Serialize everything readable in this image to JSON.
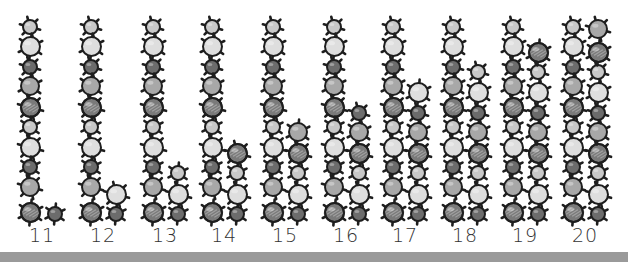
{
  "groups": [
    {
      "label": "11",
      "total": 11,
      "tens": 10,
      "ones": 1
    },
    {
      "label": "12",
      "total": 12,
      "tens": 10,
      "ones": 2
    },
    {
      "label": "13",
      "total": 13,
      "tens": 10,
      "ones": 3
    },
    {
      "label": "14",
      "total": 14,
      "tens": 10,
      "ones": 4
    },
    {
      "label": "15",
      "total": 15,
      "tens": 10,
      "ones": 5
    },
    {
      "label": "16",
      "total": 16,
      "tens": 10,
      "ones": 6
    },
    {
      "label": "17",
      "total": 17,
      "tens": 10,
      "ones": 7
    },
    {
      "label": "18",
      "total": 18,
      "tens": 10,
      "ones": 8
    },
    {
      "label": "19",
      "total": 19,
      "tens": 10,
      "ones": 9
    },
    {
      "label": "20",
      "total": 20,
      "tens": 10,
      "ones": 10
    }
  ],
  "bead_styles": {
    "small_light": {
      "r": 7,
      "fill": "#c8c8c8",
      "stripe": false
    },
    "large_pale": {
      "r": 9.5,
      "fill": "#dedede",
      "stripe": false
    },
    "small_dark": {
      "r": 7,
      "fill": "#6c6c6c",
      "stripe": false
    },
    "medium_gray": {
      "r": 9,
      "fill": "#a8a8a8",
      "stripe": false
    },
    "large_striped": {
      "r": 9.5,
      "fill": "#7a7a7a",
      "stripe": true
    }
  },
  "tens_pattern_top_to_bottom": [
    "small_light",
    "large_pale",
    "small_dark",
    "medium_gray",
    "large_striped",
    "small_light",
    "large_pale",
    "small_dark",
    "medium_gray",
    "large_striped"
  ],
  "ones_pattern_bottom_to_top": [
    "small_dark",
    "large_pale",
    "small_light",
    "large_striped",
    "medium_gray",
    "small_dark",
    "large_pale",
    "small_light",
    "large_striped",
    "medium_gray"
  ],
  "colors": {
    "outline": "#1e1e1e",
    "bar": "#9a9a9a",
    "label": "#333333",
    "background": "#ffffff"
  }
}
